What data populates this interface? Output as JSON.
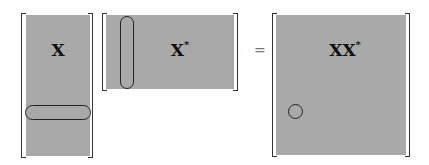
{
  "diagram": {
    "matrices": [
      {
        "id": "X",
        "label": "X",
        "superscript": "",
        "highlight": "row"
      },
      {
        "id": "Xstar",
        "label": "X",
        "superscript": "*",
        "highlight": "column"
      },
      {
        "id": "XXstar",
        "label": "XX",
        "superscript": "*",
        "highlight": "entry"
      }
    ],
    "operator": "=",
    "colors": {
      "matrix_fill": "#a9a9a9",
      "bracket": "#333333",
      "outline": "#222222"
    }
  }
}
